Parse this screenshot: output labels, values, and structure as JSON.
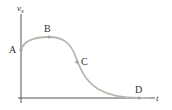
{
  "diagram": {
    "type": "velocity-time graph",
    "axes": {
      "y_label": "v",
      "y_subscript": "x",
      "x_label": "t"
    },
    "points": [
      {
        "label": "A",
        "x": 21,
        "y": 50
      },
      {
        "label": "B",
        "x": 49,
        "y": 37
      },
      {
        "label": "C",
        "x": 77,
        "y": 62
      },
      {
        "label": "D",
        "x": 139,
        "y": 98
      }
    ],
    "colors": {
      "axis": "#555555",
      "curve": "#b8b8b0",
      "point": "#a0a0a0",
      "text": "#333333"
    }
  }
}
